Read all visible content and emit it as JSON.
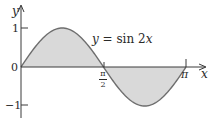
{
  "chart_data": {
    "type": "area",
    "title": "",
    "function": "y = sin 2x",
    "annotation": "y = sin 2x",
    "xlabel": "x",
    "ylabel": "y",
    "x_ticks": [
      {
        "value": 1.5708,
        "label": "π/2"
      },
      {
        "value": 3.1416,
        "label": "π"
      }
    ],
    "y_ticks": [
      {
        "value": 1,
        "label": "1"
      },
      {
        "value": 0,
        "label": "0"
      },
      {
        "value": -1,
        "label": "−1"
      }
    ],
    "xlim": [
      0,
      3.1416
    ],
    "ylim": [
      -1,
      1
    ],
    "grid": false,
    "legend": "none",
    "shaded_regions": [
      {
        "from": 0,
        "to": 1.5708,
        "sign": "positive"
      },
      {
        "from": 1.5708,
        "to": 3.1416,
        "sign": "negative"
      }
    ],
    "x": [
      0,
      0.3927,
      0.7854,
      1.1781,
      1.5708,
      1.9635,
      2.3562,
      2.7489,
      3.1416
    ],
    "series": [
      {
        "name": "sin 2x",
        "values": [
          0,
          0.7071,
          1,
          0.7071,
          0,
          -0.7071,
          -1,
          -0.7071,
          0
        ]
      }
    ],
    "colors": {
      "curve": "#6e6e6e",
      "fill": "#d9d9d9",
      "axis": "#3a3a3a"
    }
  },
  "labels": {
    "y_axis": "y",
    "x_axis": "x",
    "tick_one": "1",
    "tick_zero": "0",
    "tick_neg_one": "−1",
    "pi_half_num": "π",
    "pi_half_den": "2",
    "pi": "π",
    "func_y": "y",
    "func_eq": " = sin 2",
    "func_x": "x"
  }
}
